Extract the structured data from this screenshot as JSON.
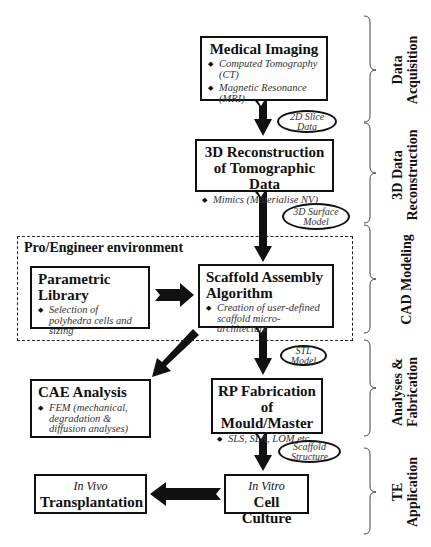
{
  "diagram": {
    "nodes": {
      "medical_imaging": {
        "title": "Medical Imaging",
        "bullets": [
          "Computed Tomography (CT)",
          "Magnetic Resonance (MRI)"
        ]
      },
      "reconstruction": {
        "title_line1": "3D Reconstruction",
        "title_line2": "of Tomographic Data",
        "bullets": [
          "Mimics (Materialise NV)"
        ]
      },
      "environment": {
        "label": "Pro/Engineer environment"
      },
      "parametric_library": {
        "title_line1": "Parametric",
        "title_line2": "Library",
        "bullets": [
          "Selection of polyhedra cells and sizing"
        ]
      },
      "scaffold_assembly": {
        "title_line1": "Scaffold Assembly",
        "title_line2": "Algorithm",
        "bullets": [
          "Creation of user-defined scaffold micro-architecture"
        ]
      },
      "cae_analysis": {
        "title": "CAE Analysis",
        "bullets": [
          "FEM (mechanical, degradation & diffusion analyses)"
        ]
      },
      "rp_fabrication": {
        "title_line1": "RP Fabrication",
        "title_line2": "of Mould/Master",
        "bullets": [
          "SLS, SLA, LOM etc."
        ]
      },
      "cell_culture": {
        "subtitle": "In Vitro",
        "title": "Cell Culture"
      },
      "transplantation": {
        "subtitle": "In Vivo",
        "title": "Transplantation"
      }
    },
    "edge_labels": {
      "slice_data": "2D Slice Data",
      "surface_model": "3D Surface Model",
      "stl_model": "STL Model",
      "scaffold_structure": "Scaffold Structure"
    },
    "stages": [
      "Data Acquisition",
      "3D Data Reconstruction",
      "CAD Modeling",
      "Analyses & Fabrication",
      "TE Application"
    ],
    "stage_lines": {
      "s0a": "Data",
      "s0b": "Acquisition",
      "s1a": "3D Data",
      "s1b": "Reconstruction",
      "s2a": "CAD Modeling",
      "s3a": "Analyses &",
      "s3b": "Fabrication",
      "s4a": "TE",
      "s4b": "Application"
    },
    "colors": {
      "ink": "#111111",
      "italic_text": "#333333",
      "background": "#ffffff"
    }
  }
}
